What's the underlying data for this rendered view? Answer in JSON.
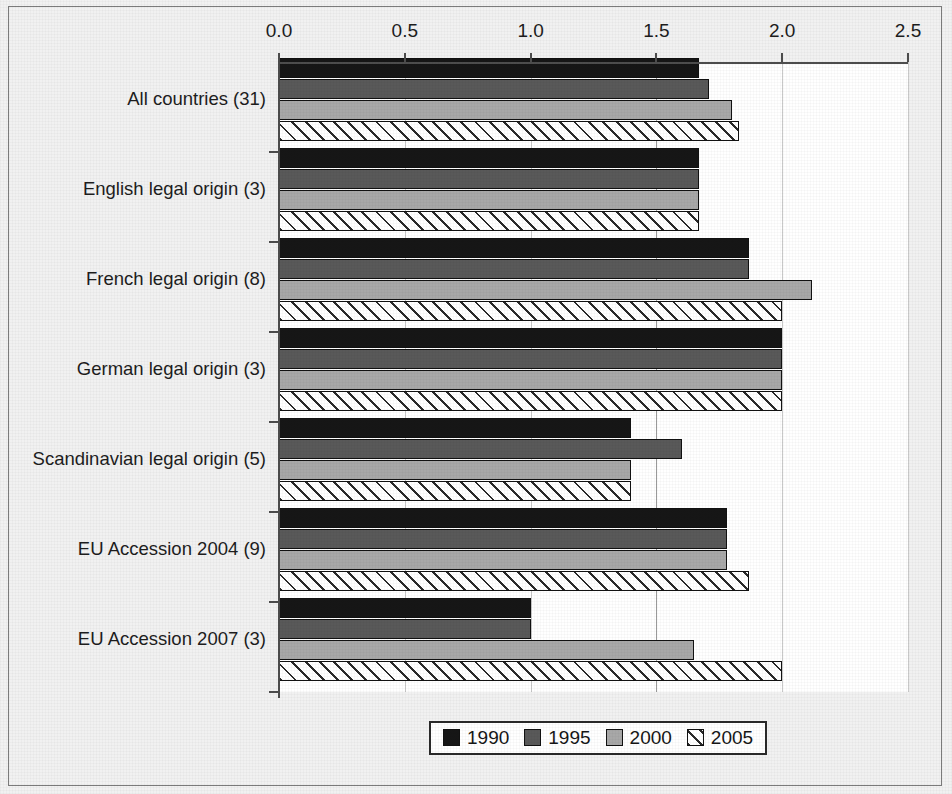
{
  "chart_data": {
    "type": "bar",
    "orientation": "horizontal",
    "title": "",
    "subtitle": "",
    "xlabel": "",
    "ylabel": "",
    "xlim": [
      0.0,
      2.5
    ],
    "xticks": [
      "0.0",
      "0.5",
      "1.0",
      "1.5",
      "2.0",
      "2.5"
    ],
    "xtick_values": [
      0.0,
      0.5,
      1.0,
      1.5,
      2.0,
      2.5
    ],
    "grid": "vertical",
    "legend_position": "bottom-center",
    "categories": [
      "All countries (31)",
      "English legal origin (3)",
      "French legal origin (8)",
      "German legal origin (3)",
      "Scandinavian legal origin (5)",
      "EU Accession 2004 (9)",
      "EU Accession 2007 (3)"
    ],
    "series": [
      {
        "name": "1990",
        "color": "#161616",
        "pattern": "solid",
        "values": [
          1.67,
          1.67,
          1.87,
          2.0,
          1.4,
          1.78,
          1.0
        ]
      },
      {
        "name": "1995",
        "color": "#595959",
        "pattern": "solid",
        "values": [
          1.71,
          1.67,
          1.87,
          2.0,
          1.6,
          1.78,
          1.0
        ]
      },
      {
        "name": "2000",
        "color": "#a8a8a8",
        "pattern": "solid",
        "values": [
          1.8,
          1.67,
          2.12,
          2.0,
          1.4,
          1.78,
          1.65
        ]
      },
      {
        "name": "2005",
        "color": "#ffffff",
        "pattern": "diagonal-hatch",
        "values": [
          1.83,
          1.67,
          2.0,
          2.0,
          1.4,
          1.87,
          2.0
        ]
      }
    ]
  },
  "legend": {
    "items": [
      {
        "label": "1990",
        "swatch": "s1990"
      },
      {
        "label": "1995",
        "swatch": "s1995"
      },
      {
        "label": "2000",
        "swatch": "s2000"
      },
      {
        "label": "2005",
        "swatch": "s2005"
      }
    ]
  }
}
